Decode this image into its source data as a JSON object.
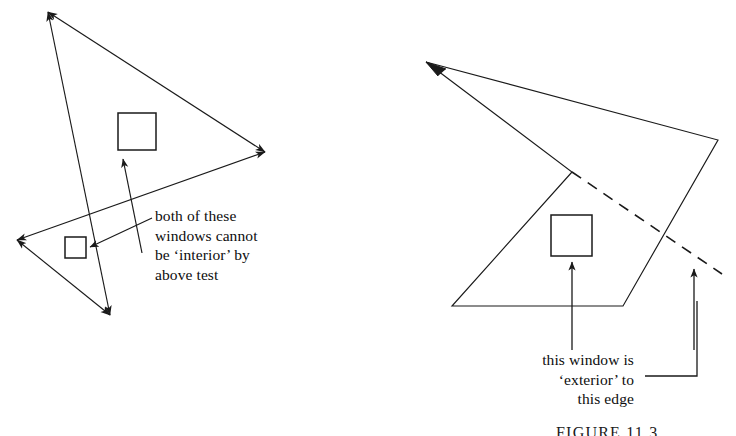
{
  "figure": {
    "caption": "FIGURE 11.3",
    "stroke_color": "#1a1a1a",
    "background_color": "#ffffff"
  },
  "annotations": {
    "left": {
      "text": "both of these\nwindows cannot\nbe ‘interior’ by\nabove test"
    },
    "right": {
      "text": "this window is\n‘exterior’ to\nthis edge"
    }
  },
  "left_diagram": {
    "name": "concave-polygon-with-two-windows",
    "polygon_points": "48,12 265,152 17,240 110,315 48,12",
    "edges": [
      {
        "name": "edge-top-right",
        "from": [
          48,
          12
        ],
        "to": [
          265,
          152
        ],
        "arrow": "both"
      },
      {
        "name": "edge-lower-right",
        "from": [
          265,
          152
        ],
        "to": [
          17,
          240
        ],
        "arrow": "both"
      },
      {
        "name": "edge-notch-bottom",
        "from": [
          17,
          240
        ],
        "to": [
          110,
          315
        ],
        "arrow": "both"
      },
      {
        "name": "edge-left-long",
        "from": [
          110,
          315
        ],
        "to": [
          48,
          12
        ],
        "arrow": "both"
      }
    ],
    "windows": [
      {
        "name": "window-upper",
        "x": 118,
        "y": 113,
        "w": 38,
        "h": 37
      },
      {
        "name": "window-lower",
        "x": 65,
        "y": 237,
        "w": 21,
        "h": 21
      }
    ],
    "pointers": [
      {
        "name": "pointer-to-upper-window",
        "from": [
          142,
          253
        ],
        "to": [
          123,
          158
        ]
      },
      {
        "name": "pointer-to-lower-window",
        "from": [
          152,
          218
        ],
        "to": [
          90,
          247
        ]
      }
    ]
  },
  "right_diagram": {
    "name": "concave-polygon-with-exterior-edge",
    "polygon_points": "426,62 718,140 623,306 452,306 572,172 426,62",
    "edges": [
      {
        "name": "edge-top",
        "from": [
          426,
          62
        ],
        "to": [
          718,
          140
        ],
        "dashed": false
      },
      {
        "name": "edge-right",
        "from": [
          718,
          140
        ],
        "to": [
          623,
          306
        ],
        "dashed": false
      },
      {
        "name": "edge-bottom",
        "from": [
          623,
          306
        ],
        "to": [
          452,
          306
        ],
        "dashed": false
      },
      {
        "name": "edge-notch-up",
        "from": [
          452,
          306
        ],
        "to": [
          572,
          172
        ],
        "dashed": false
      },
      {
        "name": "edge-notch-back",
        "from": [
          572,
          172
        ],
        "to": [
          426,
          62
        ],
        "dashed": false
      },
      {
        "name": "edge-extension-dashed",
        "from": [
          572,
          172
        ],
        "to": [
          722,
          274
        ],
        "dashed": true
      }
    ],
    "windows": [
      {
        "name": "window-interior",
        "x": 551,
        "y": 215,
        "w": 41,
        "h": 41
      }
    ],
    "pointers": [
      {
        "name": "pointer-to-window",
        "from": [
          572,
          348
        ],
        "to": [
          572,
          261
        ]
      },
      {
        "name": "pointer-to-dashed-edge",
        "from": [
          694,
          348
        ],
        "to": [
          694,
          268
        ]
      }
    ],
    "connectors": [
      {
        "name": "elbow-connector-to-edge",
        "points": "645,376 697,376 697,300"
      }
    ]
  }
}
